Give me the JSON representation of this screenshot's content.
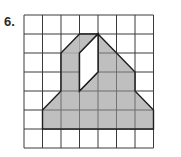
{
  "problem": {
    "number_label": "6.",
    "grid": {
      "columns": 8,
      "rows": 7,
      "line_color": "#3a3a3a"
    },
    "figure": {
      "fill_color": "#b4b4b4",
      "stroke_color": "#1e1e1e",
      "outline_vertices": [
        [
          2,
          5
        ],
        [
          2,
          3
        ],
        [
          3,
          2
        ],
        [
          4,
          1
        ],
        [
          5,
          1
        ],
        [
          4,
          2
        ],
        [
          4,
          4
        ],
        [
          2,
          5
        ]
      ],
      "description": "Shaded polygon on grid with an unshaded parallelogram hole"
    }
  }
}
